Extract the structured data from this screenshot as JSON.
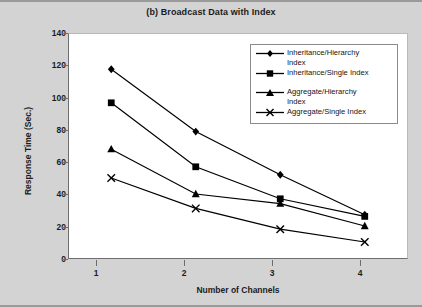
{
  "chart_data": {
    "type": "line",
    "title": "(b) Broadcast Data with Index",
    "xlabel": "Number of Channels",
    "ylabel": "Response Time (Sec.)",
    "x": [
      1,
      2,
      3,
      4
    ],
    "categories": [
      "1",
      "2",
      "3",
      "4"
    ],
    "xtick_labels": [
      "1",
      "2",
      "3",
      "4"
    ],
    "ytick_labels": [
      "0",
      "20",
      "40",
      "60",
      "80",
      "100",
      "120",
      "140"
    ],
    "yticks": [
      0,
      20,
      40,
      60,
      80,
      100,
      120,
      140
    ],
    "ylim": [
      0,
      140
    ],
    "xlim": [
      0.5,
      4.5
    ],
    "grid": false,
    "legend_position": "top-right inside plot",
    "series": [
      {
        "name": "Inheritance/Hierarchy Index",
        "marker": "diamond",
        "color": "#000000",
        "values": [
          118,
          79,
          52,
          27
        ]
      },
      {
        "name": "Inheritance/Single Index",
        "marker": "square",
        "color": "#000000",
        "values": [
          97,
          57,
          37,
          26
        ]
      },
      {
        "name": "Aggregate/Hierarchy Index",
        "marker": "triangle",
        "color": "#000000",
        "values": [
          68,
          40,
          34,
          20
        ]
      },
      {
        "name": "Aggregate/Single Index",
        "marker": "x",
        "color": "#000000",
        "values": [
          50,
          31,
          18,
          10
        ]
      }
    ]
  },
  "legend": {
    "items": [
      {
        "label_line1": "Inheritance/Hierarchy",
        "label_line2": "Index",
        "marker": "diamond"
      },
      {
        "label_line1": "Inheritance/Single Index",
        "label_line2": "",
        "marker": "square"
      },
      {
        "label_line1": "Aggregate/Hierarchy",
        "label_line2": "Index",
        "marker": "triangle"
      },
      {
        "label_line1": "Aggregate/Single Index",
        "label_line2": "",
        "marker": "x"
      }
    ]
  },
  "colors": {
    "page_background": "#d3d3d3",
    "plot_background": "#ffffff",
    "axis": "#6e6e6e",
    "series": "#000000",
    "text": "#1c1c1c"
  }
}
